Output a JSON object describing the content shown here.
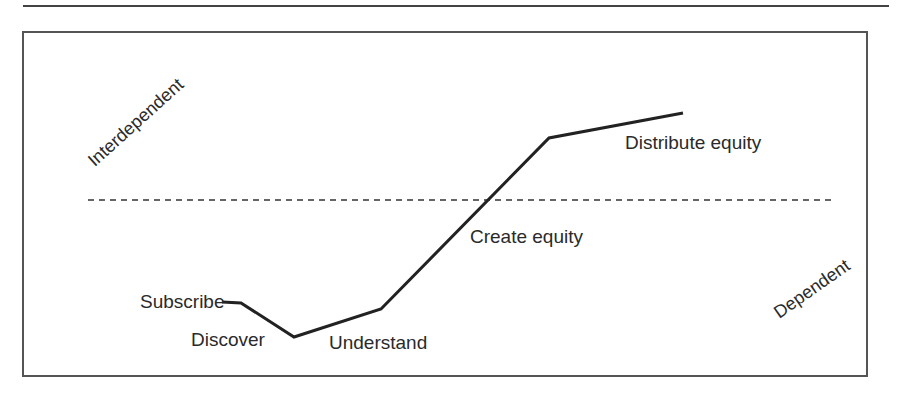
{
  "diagram": {
    "labels": {
      "interdependent": "Interdependent",
      "dependent": "Dependent",
      "subscribe": "Subscribe",
      "discover": "Discover",
      "understand": "Understand",
      "create_equity": "Create equity",
      "distribute_equity": "Distribute equity"
    },
    "path_points": [
      [
        222,
        302
      ],
      [
        241,
        303
      ],
      [
        294,
        337
      ],
      [
        381,
        309
      ],
      [
        549,
        138
      ],
      [
        683,
        113
      ]
    ],
    "divider": {
      "y": 200,
      "x1": 88,
      "x2": 835,
      "style": "dashed"
    },
    "colors": {
      "line": "#222222",
      "frame": "#555555",
      "text": "#2a2a2a"
    }
  }
}
